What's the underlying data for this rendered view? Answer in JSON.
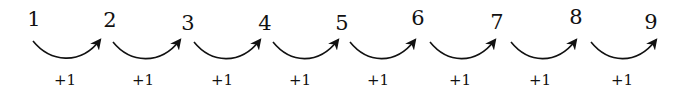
{
  "diagram": {
    "title": "",
    "numbers": [
      "1",
      "2",
      "3",
      "4",
      "5",
      "6",
      "7",
      "8",
      "9"
    ],
    "step_labels": [
      "+1",
      "+1",
      "+1",
      "+1",
      "+1",
      "+1",
      "+1",
      "+1"
    ],
    "colors": {
      "ink": "#111111",
      "background": "#ffffff"
    }
  }
}
